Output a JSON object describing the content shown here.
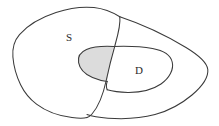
{
  "diagram": {
    "type": "venn-diagram",
    "background_color": "#ffffff",
    "stroke_color": "#3a3a3a",
    "labels": {
      "set_s": "S",
      "set_d": "D"
    },
    "regions": [
      {
        "name": "outer-blob-s",
        "label": "S",
        "shaded": false,
        "fill_color": "#ffffff"
      },
      {
        "name": "outer-blob-right",
        "label": "",
        "shaded": false,
        "fill_color": "#ffffff"
      },
      {
        "name": "inner-oval-d",
        "label": "D",
        "shaded": false,
        "fill_color": "#ffffff"
      },
      {
        "name": "intersection-s-and-d",
        "label": "",
        "shaded": true,
        "fill_color": "#dcdcdc"
      }
    ],
    "label_positions": {
      "set_s": {
        "x": 69,
        "y": 38
      },
      "set_d": {
        "x": 139,
        "y": 71
      }
    }
  }
}
